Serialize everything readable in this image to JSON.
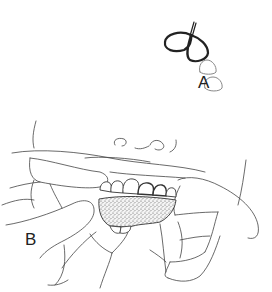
{
  "figure": {
    "panels": [
      {
        "label": "A",
        "depicts": "floss-loop-between-teeth"
      },
      {
        "label": "B",
        "depicts": "fingers-holding-gauze-over-lower-teeth"
      }
    ],
    "colors": {
      "line": "#333333",
      "gauze_fill": "#d8d8d8",
      "background": "#ffffff"
    }
  }
}
